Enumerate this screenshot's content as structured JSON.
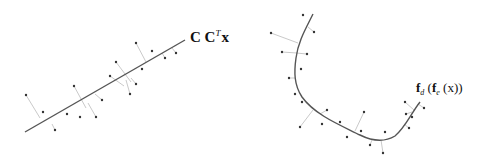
{
  "left_panel": {
    "label_main": "C C",
    "label_sup": "T",
    "label_var": "x",
    "line": {
      "x1": 25,
      "y1": 132,
      "x2": 185,
      "y2": 40
    },
    "points": [
      [
        26,
        95,
        40,
        118
      ],
      [
        43,
        112,
        43,
        112
      ],
      [
        55,
        130,
        52,
        124
      ],
      [
        67,
        114,
        67,
        114
      ],
      [
        74,
        86,
        86,
        108
      ],
      [
        80,
        117,
        80,
        117
      ],
      [
        96,
        117,
        88,
        103
      ],
      [
        102,
        100,
        95,
        94
      ],
      [
        110,
        76,
        124,
        86
      ],
      [
        116,
        62,
        131,
        82
      ],
      [
        130,
        94,
        126,
        80
      ],
      [
        136,
        84,
        131,
        78
      ],
      [
        142,
        69,
        142,
        69
      ],
      [
        136,
        43,
        146,
        62
      ],
      [
        152,
        51,
        152,
        51
      ],
      [
        165,
        58,
        162,
        53
      ],
      [
        176,
        53,
        172,
        48
      ]
    ]
  },
  "right_panel": {
    "label": "f_d (f_e (x))",
    "label_parts": {
      "f1": "f",
      "sub1": "d",
      "open1": " (",
      "f2": "f",
      "sub2": "e",
      "rest": " (x))"
    },
    "curve": "M313,14 C305,30 298,42 296,58 C294,72 294,85 302,97 C315,115 340,125 360,135 C372,141 385,142 395,136 C405,128 412,112 420,102",
    "points": [
      [
        303,
        15,
        303,
        15
      ],
      [
        314,
        32,
        308,
        27
      ],
      [
        271,
        33,
        298,
        43
      ],
      [
        282,
        52,
        297,
        53
      ],
      [
        307,
        54,
        296,
        53
      ],
      [
        301,
        69,
        301,
        69
      ],
      [
        289,
        78,
        295,
        78
      ],
      [
        295,
        94,
        295,
        94
      ],
      [
        302,
        102,
        302,
        102
      ],
      [
        300,
        127,
        313,
        110
      ],
      [
        327,
        110,
        320,
        114
      ],
      [
        322,
        124,
        322,
        124
      ],
      [
        340,
        122,
        340,
        122
      ],
      [
        364,
        112,
        355,
        131
      ],
      [
        347,
        137,
        347,
        137
      ],
      [
        361,
        131,
        361,
        131
      ],
      [
        370,
        145,
        372,
        140
      ],
      [
        385,
        132,
        385,
        132
      ],
      [
        383,
        153,
        381,
        140
      ],
      [
        406,
        114,
        412,
        112
      ],
      [
        405,
        102,
        414,
        110
      ],
      [
        412,
        117,
        412,
        117
      ],
      [
        409,
        128,
        404,
        124
      ],
      [
        424,
        108,
        418,
        104
      ]
    ]
  },
  "colors": {
    "line": "#555555",
    "point": "#333333",
    "projection": "#bbbbbb"
  }
}
